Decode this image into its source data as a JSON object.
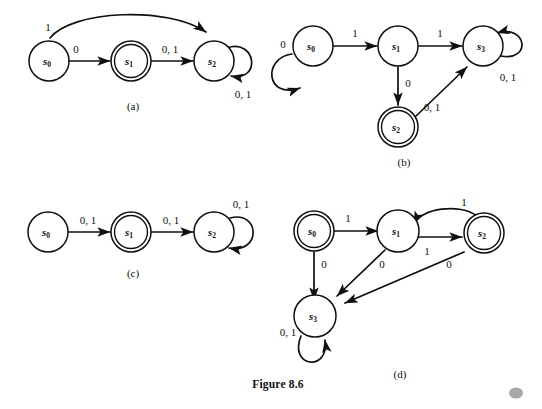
{
  "figure": {
    "caption": "Figure 8.6",
    "panels": [
      {
        "id": "a",
        "label": "(a)",
        "states": [
          {
            "name": "s0",
            "base": "s",
            "sub": "0",
            "accepting": false
          },
          {
            "name": "s1",
            "base": "s",
            "sub": "1",
            "accepting": true
          },
          {
            "name": "s2",
            "base": "s",
            "sub": "2",
            "accepting": false
          }
        ],
        "transitions": [
          {
            "from": "s0",
            "to": "s2",
            "label": "1"
          },
          {
            "from": "s0",
            "to": "s1",
            "label": "0"
          },
          {
            "from": "s1",
            "to": "s2",
            "label": "0, 1"
          },
          {
            "from": "s2",
            "to": "s2",
            "label": "0, 1"
          }
        ]
      },
      {
        "id": "b",
        "label": "(b)",
        "states": [
          {
            "name": "s0",
            "base": "s",
            "sub": "0",
            "accepting": false
          },
          {
            "name": "s1",
            "base": "s",
            "sub": "1",
            "accepting": false
          },
          {
            "name": "s2",
            "base": "s",
            "sub": "2",
            "accepting": true
          },
          {
            "name": "s3",
            "base": "s",
            "sub": "3",
            "accepting": false
          }
        ],
        "transitions": [
          {
            "from": "s0",
            "to": "s0",
            "label": "0"
          },
          {
            "from": "s0",
            "to": "s1",
            "label": "1"
          },
          {
            "from": "s1",
            "to": "s3",
            "label": "1"
          },
          {
            "from": "s1",
            "to": "s2",
            "label": "0"
          },
          {
            "from": "s2",
            "to": "s3",
            "label": "0, 1"
          },
          {
            "from": "s3",
            "to": "s3",
            "label": "0, 1"
          }
        ]
      },
      {
        "id": "c",
        "label": "(c)",
        "states": [
          {
            "name": "s0",
            "base": "s",
            "sub": "0",
            "accepting": false
          },
          {
            "name": "s1",
            "base": "s",
            "sub": "1",
            "accepting": true
          },
          {
            "name": "s2",
            "base": "s",
            "sub": "2",
            "accepting": false
          }
        ],
        "transitions": [
          {
            "from": "s0",
            "to": "s1",
            "label": "0, 1"
          },
          {
            "from": "s1",
            "to": "s2",
            "label": "0, 1"
          },
          {
            "from": "s2",
            "to": "s2",
            "label": "0, 1"
          }
        ]
      },
      {
        "id": "d",
        "label": "(d)",
        "states": [
          {
            "name": "s0",
            "base": "s",
            "sub": "0",
            "accepting": true
          },
          {
            "name": "s1",
            "base": "s",
            "sub": "1",
            "accepting": false
          },
          {
            "name": "s2",
            "base": "s",
            "sub": "2",
            "accepting": true
          },
          {
            "name": "s3",
            "base": "s",
            "sub": "3",
            "accepting": false
          }
        ],
        "transitions": [
          {
            "from": "s0",
            "to": "s1",
            "label": "1"
          },
          {
            "from": "s0",
            "to": "s3",
            "label": "0"
          },
          {
            "from": "s1",
            "to": "s2",
            "label": "1"
          },
          {
            "from": "s1",
            "to": "s3",
            "label": "0"
          },
          {
            "from": "s2",
            "to": "s1",
            "label": "1"
          },
          {
            "from": "s2",
            "to": "s3",
            "label": "0"
          },
          {
            "from": "s3",
            "to": "s3",
            "label": "0, 1"
          }
        ]
      }
    ]
  },
  "colors": {
    "background": "#ffffff",
    "ink": "#101010",
    "corner_dot": "#a8a8a8"
  }
}
